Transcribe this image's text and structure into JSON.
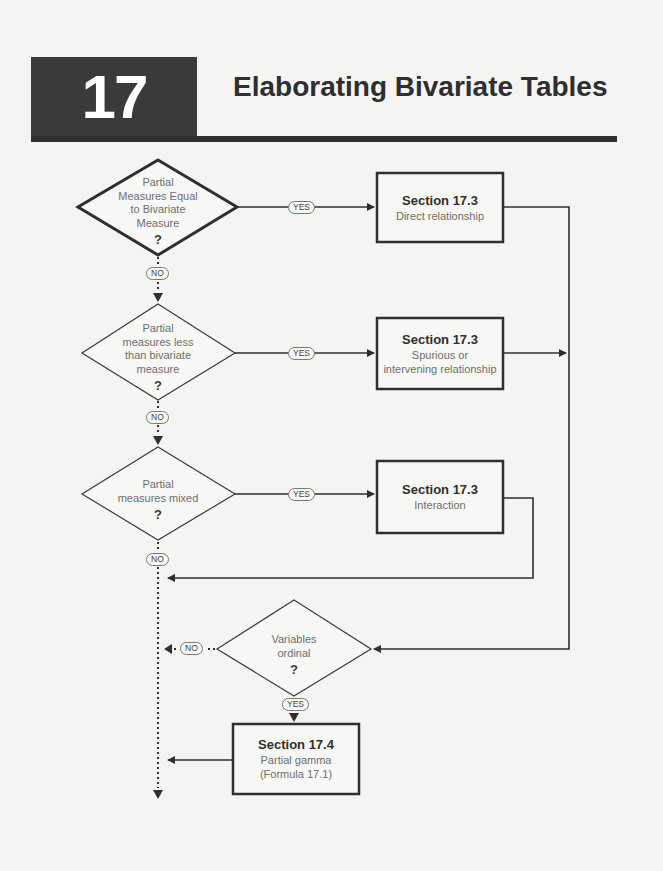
{
  "header": {
    "chapter_number": "17",
    "chapter_title": "Elaborating Bivariate Tables"
  },
  "flowchart": {
    "decisions": [
      {
        "id": "d1",
        "lines": [
          "Partial",
          "Measures Equal",
          "to Bivariate",
          "Measure"
        ],
        "question_mark": "?",
        "yes_label": "YES",
        "no_label": "NO"
      },
      {
        "id": "d2",
        "lines": [
          "Partial",
          "measures less",
          "than bivariate",
          "measure"
        ],
        "question_mark": "?",
        "yes_label": "YES",
        "no_label": "NO"
      },
      {
        "id": "d3",
        "lines": [
          "Partial",
          "measures mixed"
        ],
        "question_mark": "?",
        "yes_label": "YES",
        "no_label": "NO"
      },
      {
        "id": "d4",
        "lines": [
          "Variables",
          "ordinal"
        ],
        "question_mark": "?",
        "yes_label": "YES",
        "no_label": "NO"
      }
    ],
    "results": [
      {
        "id": "r1",
        "title": "Section 17.3",
        "desc_lines": [
          "Direct relationship"
        ]
      },
      {
        "id": "r2",
        "title": "Section 17.3",
        "desc_lines": [
          "Spurious or",
          "intervening relationship"
        ]
      },
      {
        "id": "r3",
        "title": "Section 17.3",
        "desc_lines": [
          "Interaction"
        ]
      },
      {
        "id": "r4",
        "title": "Section 17.4",
        "desc_lines": [
          "Partial gamma",
          "(Formula 17.1)"
        ]
      }
    ]
  },
  "colors": {
    "background": "#f4f4f2",
    "chapter_box": "#3a3a3a",
    "line": "#2f2f2f",
    "text_muted": "#6e6e6e"
  }
}
